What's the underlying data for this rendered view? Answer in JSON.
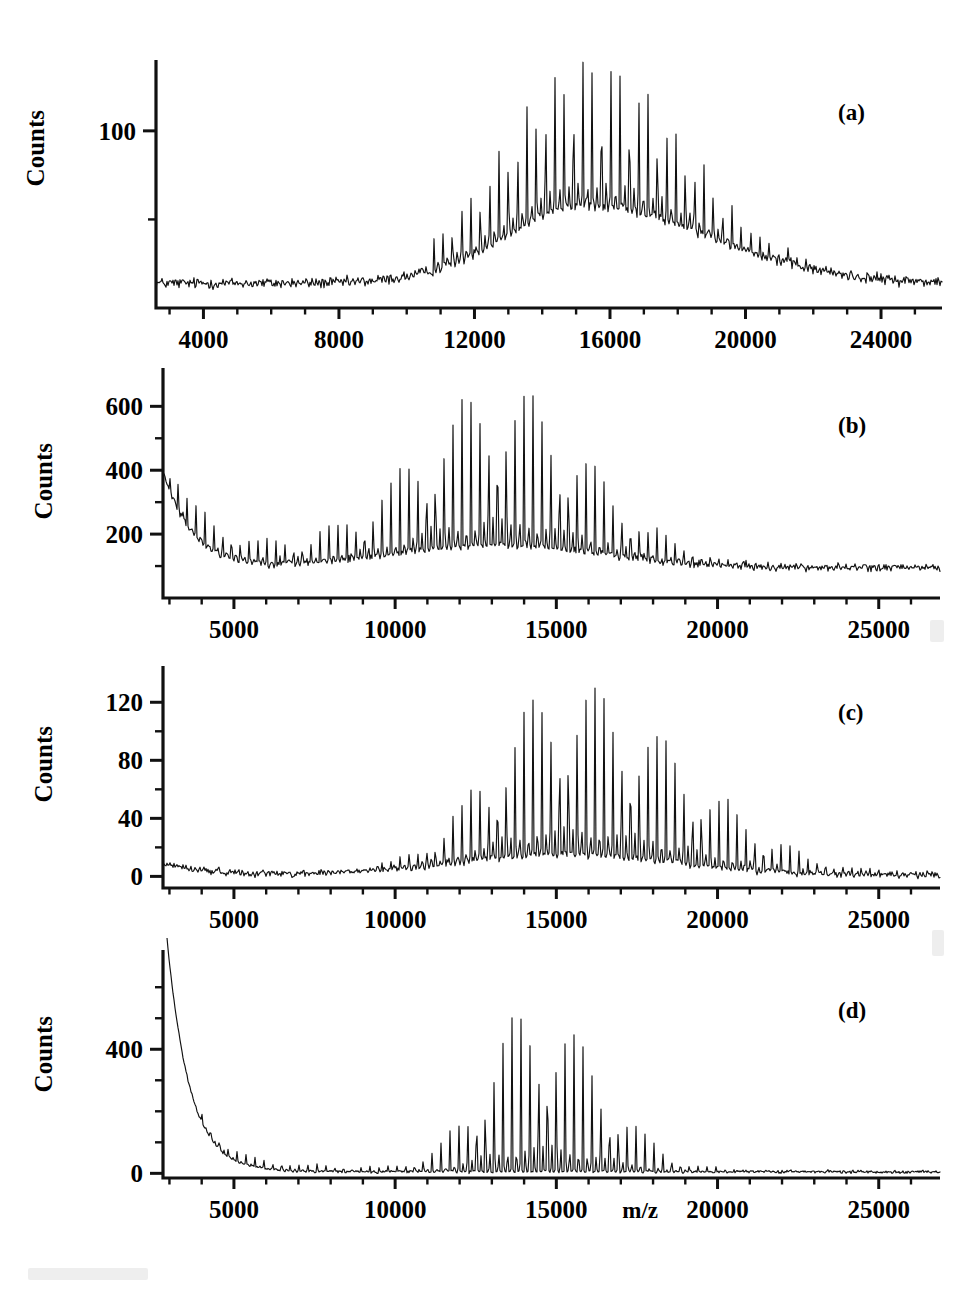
{
  "figure": {
    "title": "",
    "panel_labels": [
      "(a)",
      "(b)",
      "(c)",
      "(d)"
    ],
    "y_axis_title": "Counts",
    "x_axis_title": "m/z"
  },
  "chart_data": [
    {
      "type": "line",
      "panel": "(a)",
      "title": "",
      "xlabel": "",
      "ylabel": "Counts",
      "xlim": [
        2600,
        25800
      ],
      "ylim": [
        0,
        140
      ],
      "xticks": [
        4000,
        8000,
        12000,
        16000,
        20000,
        24000
      ],
      "xtick_labels": [
        "4000",
        "8000",
        "12000",
        "16000",
        "20000",
        "24000"
      ],
      "xminor_step": 1000,
      "yticks": [
        100
      ],
      "ytick_labels": [
        "100"
      ],
      "yminor": [
        50
      ],
      "grid": false,
      "legend": "none",
      "envelope": {
        "baseline": 14,
        "peak_center": 15300,
        "peak_height": 44,
        "peak_width_left": 2400,
        "peak_width_right": 3600
      },
      "comb": {
        "period": 275,
        "start": 10800,
        "spike_center": 15400,
        "spike_height": 85,
        "spike_width": 2600,
        "noise": 2.6
      }
    },
    {
      "type": "line",
      "panel": "(b)",
      "title": "",
      "xlabel": "",
      "ylabel": "Counts",
      "xlim": [
        2800,
        26900
      ],
      "ylim": [
        0,
        720
      ],
      "xticks": [
        5000,
        10000,
        15000,
        20000,
        25000
      ],
      "xtick_labels": [
        "5000",
        "10000",
        "15000",
        "20000",
        "25000"
      ],
      "xminor_step": 1000,
      "yticks": [
        600,
        400,
        200
      ],
      "ytick_labels": [
        "600",
        "400",
        "200"
      ],
      "yminor": [
        500,
        300,
        100
      ],
      "grid": false,
      "legend": "none",
      "envelope": {
        "baseline": 95,
        "decay_amp": 300,
        "decay_tau": 900,
        "bump_center": 13200,
        "bump_height": 70,
        "bump_width": 3200
      },
      "comb": {
        "period": 275,
        "start": 3000,
        "low_height": 120,
        "spike_center": 13300,
        "spike_height": 480,
        "spike_width": 2600,
        "noise": 10
      }
    },
    {
      "type": "line",
      "panel": "(c)",
      "title": "",
      "xlabel": "",
      "ylabel": "Counts",
      "xlim": [
        2800,
        26900
      ],
      "ylim": [
        -8,
        145
      ],
      "xticks": [
        5000,
        10000,
        15000,
        20000,
        25000
      ],
      "xtick_labels": [
        "5000",
        "10000",
        "15000",
        "20000",
        "25000"
      ],
      "xminor_step": 1000,
      "yticks": [
        120,
        80,
        40,
        0
      ],
      "ytick_labels": [
        "120",
        "80",
        "40",
        "0"
      ],
      "yminor": [
        100,
        60,
        20
      ],
      "grid": false,
      "legend": "none",
      "envelope": {
        "baseline": 1,
        "low_bump": 8,
        "bump_center": 15300,
        "bump_height": 14,
        "bump_width": 3400
      },
      "comb": {
        "period": 275,
        "start": 3000,
        "spike_center": 15300,
        "spike_height": 120,
        "spike_width_left": 2200,
        "spike_width_right": 3600,
        "noise": 2
      }
    },
    {
      "type": "line",
      "panel": "(d)",
      "title": "",
      "xlabel": "m/z",
      "ylabel": "Counts",
      "xlim": [
        2800,
        26900
      ],
      "ylim": [
        -15,
        720
      ],
      "xticks": [
        5000,
        10000,
        15000,
        20000,
        25000
      ],
      "xtick_labels": [
        "5000",
        "10000",
        "15000",
        "20000",
        "25000"
      ],
      "xminor_step": 1000,
      "yticks": [
        400,
        0
      ],
      "ytick_labels": [
        "400",
        "0"
      ],
      "yminor": [
        600,
        500,
        300,
        200,
        100
      ],
      "grid": false,
      "legend": "none",
      "envelope": {
        "baseline": 5,
        "decay_amp": 900,
        "decay_tau": 700
      },
      "comb": {
        "period": 275,
        "start": 4000,
        "low_height": 40,
        "spike_center": 14300,
        "spike_height": 540,
        "spike_width_left": 1500,
        "spike_width_right": 2000,
        "noise": 4
      }
    }
  ]
}
